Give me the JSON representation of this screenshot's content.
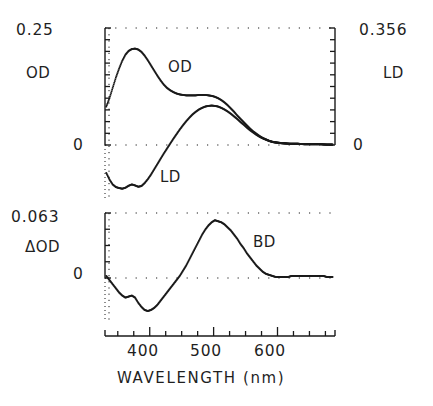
{
  "figure": {
    "title_x": "WAVELENGTH (nm)",
    "panels": [
      {
        "id": "top",
        "left_axis_label": "OD",
        "left_axis_max": "0.25",
        "left_axis_zero": "0",
        "right_axis_label": "LD",
        "right_axis_max": "0.356",
        "right_axis_zero": "0",
        "curve_labels": [
          "OD",
          "LD"
        ]
      },
      {
        "id": "bottom",
        "left_axis_label": "ΔOD",
        "left_axis_max": "0.063",
        "left_axis_zero": "0",
        "curve_labels": [
          "BD"
        ]
      }
    ],
    "xticklabels": [
      "400",
      "500",
      "600"
    ]
  },
  "chart_data": {
    "type": "scatter",
    "title": "",
    "xlabel": "WAVELENGTH (nm)",
    "xlim": [
      330,
      690
    ],
    "xticks": [
      350,
      375,
      400,
      425,
      450,
      475,
      500,
      525,
      550,
      575,
      600,
      625,
      650,
      675
    ],
    "xticklabels_shown": {
      "400": 400,
      "500": 500,
      "600": 600
    },
    "grid": "dotted",
    "legend": "inline-annotations",
    "panels": [
      {
        "name": "top",
        "ylabel_left": "OD",
        "ylim_left": [
          -0.0935,
          0.25
        ],
        "yticklabels_left": [
          "0.25",
          "0"
        ],
        "ylabel_right": "LD",
        "ylim_right": [
          -0.1332,
          0.356
        ],
        "yticklabels_right": [
          "0.356",
          "0"
        ],
        "series": [
          {
            "name": "OD",
            "axis": "left",
            "x": [
              332,
              337,
              342,
              347,
              352,
              357,
              362,
              367,
              372,
              377,
              382,
              387,
              392,
              397,
              402,
              407,
              412,
              417,
              422,
              427,
              432,
              437,
              442,
              447,
              452,
              457,
              462,
              467,
              472,
              477,
              482,
              487,
              492,
              497,
              502,
              507,
              512,
              517,
              522,
              527,
              532,
              537,
              542,
              547,
              552,
              557,
              562,
              567,
              572,
              577,
              582,
              587,
              592,
              597,
              602,
              607,
              612,
              617,
              622,
              627,
              632,
              637,
              642,
              647,
              652,
              657,
              662,
              667,
              672,
              677,
              682,
              687
            ],
            "y": [
              0.082,
              0.1,
              0.122,
              0.144,
              0.163,
              0.18,
              0.193,
              0.201,
              0.205,
              0.206,
              0.204,
              0.199,
              0.191,
              0.181,
              0.17,
              0.159,
              0.148,
              0.138,
              0.129,
              0.122,
              0.117,
              0.113,
              0.11,
              0.108,
              0.107,
              0.106,
              0.106,
              0.106,
              0.106,
              0.107,
              0.107,
              0.107,
              0.106,
              0.105,
              0.103,
              0.1,
              0.096,
              0.091,
              0.085,
              0.078,
              0.071,
              0.063,
              0.056,
              0.049,
              0.042,
              0.035,
              0.029,
              0.024,
              0.019,
              0.015,
              0.012,
              0.009,
              0.007,
              0.006,
              0.005,
              0.004,
              0.004,
              0.003,
              0.003,
              0.003,
              0.003,
              0.002,
              0.002,
              0.002,
              0.002,
              0.002,
              0.002,
              0.002,
              0.001,
              0.001,
              0.001,
              0.001
            ]
          },
          {
            "name": "LD",
            "axis": "right",
            "x": [
              332,
              337,
              342,
              347,
              352,
              357,
              362,
              367,
              372,
              377,
              382,
              387,
              392,
              397,
              402,
              407,
              412,
              417,
              422,
              427,
              432,
              437,
              442,
              447,
              452,
              457,
              462,
              467,
              472,
              477,
              482,
              487,
              492,
              497,
              502,
              507,
              512,
              517,
              522,
              527,
              532,
              537,
              542,
              547,
              552,
              557,
              562,
              567,
              572,
              577,
              582,
              587,
              592,
              597,
              602,
              607,
              612,
              617,
              622,
              627,
              632,
              637,
              642,
              647,
              652,
              657,
              662,
              667,
              672,
              677,
              682,
              687
            ],
            "y": [
              -0.085,
              -0.105,
              -0.12,
              -0.128,
              -0.131,
              -0.133,
              -0.13,
              -0.124,
              -0.12,
              -0.123,
              -0.127,
              -0.125,
              -0.116,
              -0.104,
              -0.09,
              -0.074,
              -0.058,
              -0.042,
              -0.026,
              -0.011,
              0.004,
              0.019,
              0.033,
              0.047,
              0.06,
              0.072,
              0.083,
              0.093,
              0.101,
              0.108,
              0.113,
              0.117,
              0.119,
              0.12,
              0.119,
              0.117,
              0.113,
              0.108,
              0.102,
              0.095,
              0.087,
              0.079,
              0.07,
              0.062,
              0.053,
              0.045,
              0.038,
              0.031,
              0.025,
              0.02,
              0.016,
              0.012,
              0.009,
              0.007,
              0.006,
              0.005,
              0.004,
              0.004,
              0.003,
              0.003,
              0.003,
              0.003,
              0.002,
              0.002,
              0.002,
              0.002,
              0.002,
              0.002,
              0.002,
              0.001,
              0.001,
              0.001
            ]
          }
        ]
      },
      {
        "name": "bottom",
        "ylabel_left": "ΔOD",
        "ylim_left": [
          -0.0397,
          0.063
        ],
        "yticklabels_left": [
          "0.063",
          "0"
        ],
        "series": [
          {
            "name": "BD",
            "axis": "left",
            "x": [
              332,
              337,
              342,
              347,
              352,
              357,
              362,
              367,
              372,
              377,
              382,
              387,
              392,
              397,
              402,
              407,
              412,
              417,
              422,
              427,
              432,
              437,
              442,
              447,
              452,
              457,
              462,
              467,
              472,
              477,
              482,
              487,
              492,
              497,
              502,
              507,
              512,
              517,
              522,
              527,
              532,
              537,
              542,
              547,
              552,
              557,
              562,
              567,
              572,
              577,
              582,
              587,
              592,
              597,
              602,
              607,
              612,
              617,
              622,
              627,
              632,
              637,
              642,
              647,
              652,
              657,
              662,
              667,
              672,
              677,
              682,
              687
            ],
            "y": [
              0.002,
              -0.002,
              -0.006,
              -0.01,
              -0.014,
              -0.017,
              -0.019,
              -0.018,
              -0.017,
              -0.019,
              -0.024,
              -0.028,
              -0.031,
              -0.032,
              -0.031,
              -0.029,
              -0.026,
              -0.022,
              -0.018,
              -0.014,
              -0.01,
              -0.006,
              -0.002,
              0.002,
              0.007,
              0.012,
              0.018,
              0.024,
              0.03,
              0.036,
              0.042,
              0.047,
              0.051,
              0.054,
              0.056,
              0.055,
              0.054,
              0.052,
              0.049,
              0.046,
              0.042,
              0.038,
              0.033,
              0.029,
              0.024,
              0.02,
              0.016,
              0.012,
              0.009,
              0.006,
              0.004,
              0.003,
              0.002,
              0.001,
              0.001,
              0.001,
              0.001,
              0.001,
              0.002,
              0.002,
              0.002,
              0.002,
              0.002,
              0.002,
              0.002,
              0.002,
              0.002,
              0.002,
              0.002,
              0.001,
              0.001,
              0.001
            ]
          }
        ]
      }
    ]
  }
}
